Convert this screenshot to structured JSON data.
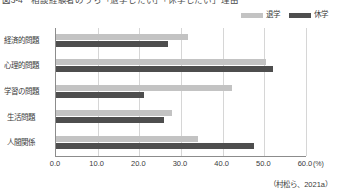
{
  "chart_data": {
    "type": "bar",
    "orientation": "horizontal",
    "title": "図3-4　相談経験者のうち「退学したい」「休学したい」理由",
    "categories": [
      "経済的問題",
      "心理的問題",
      "学習の問題",
      "生活問題",
      "人間関係"
    ],
    "series": [
      {
        "name": "退学",
        "color": "#c3c3c3",
        "values": [
          31.7,
          50.4,
          42.2,
          27.8,
          34.1
        ]
      },
      {
        "name": "休学",
        "color": "#4e4e4e",
        "values": [
          26.9,
          52.1,
          21.1,
          25.9,
          47.5
        ]
      }
    ],
    "xlabel": "",
    "ylabel": "",
    "xunit": "(%)",
    "xlim": [
      0.0,
      60.0
    ],
    "xticks": [
      "0.0",
      "10.0",
      "20.0",
      "30.0",
      "40.0",
      "50.0",
      "60.0"
    ],
    "xtick_values": [
      0,
      10,
      20,
      30,
      40,
      50,
      60
    ],
    "grid": "vertical",
    "legend_position": "top-right",
    "source_note": "（村松ら、2021a）"
  }
}
